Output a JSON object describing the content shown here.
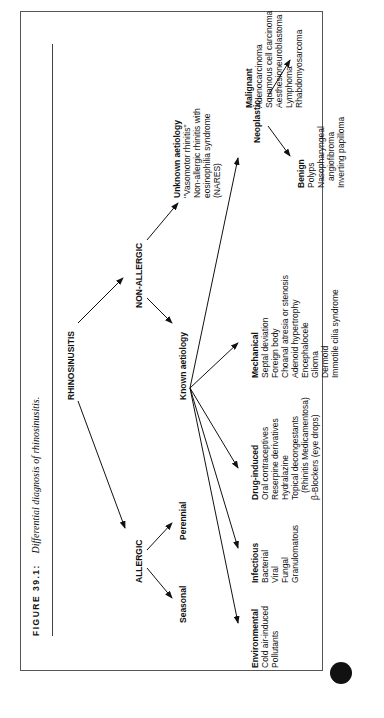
{
  "figure": {
    "label": "FIGURE 39.1:",
    "caption": "Differential diagnosis of rhinosinusitis."
  },
  "root": "RHINOSINUSITIS",
  "allergic": {
    "label": "ALLERGIC",
    "children": [
      "Seasonal",
      "Perennial"
    ]
  },
  "non_allergic": {
    "label": "NON-ALLERGIC",
    "unknown": {
      "title": "Unknown aetiology",
      "items": [
        "\"Vasomotor rhinitis\"",
        "Non-allergic rhinitis with",
        "eosinophilia syndrome",
        "(NARES)"
      ]
    },
    "known": {
      "title": "Known aetiology",
      "environmental": {
        "title": "Environmental",
        "items": [
          "Cold air-induced",
          "Pollutants"
        ]
      },
      "infectious": {
        "title": "Infectious",
        "items": [
          "Bacterial",
          "Viral",
          "Fungal",
          "Granulomatous"
        ]
      },
      "drug_induced": {
        "title": "Drug-induced",
        "items": [
          "Oral contraceptives",
          "Reserpine derivatives",
          "Hydralazine",
          "Topical decongestants",
          "(Rhinitis Medicamentosa)",
          "β-Blockers (eye drops)"
        ]
      },
      "mechanical": {
        "title": "Mechanical",
        "items": [
          "Septal deviation",
          "Foreign body",
          "Choanal atresia or stenosis",
          "Adenoid hypertrophy",
          "Encephalocele",
          "Glioma",
          "Dermoid",
          "Immotile cilia syndrome"
        ]
      },
      "neoplastic": {
        "title": "Neoplastic",
        "benign": {
          "title": "Benign",
          "items": [
            "Polyps",
            "Nasopharyngeal",
            "angiofibroma",
            "Inverting papilloma"
          ]
        },
        "malignant": {
          "title": "Malignant",
          "items": [
            "Adenocarcinoma",
            "Squamous cell carcinoma",
            "Aesthesioneuroblastoma",
            "Lymphoma",
            "Rhabdomyosarcoma"
          ]
        }
      }
    }
  },
  "colors": {
    "ink": "#111111",
    "frame": "#555555",
    "background": "#ffffff"
  }
}
